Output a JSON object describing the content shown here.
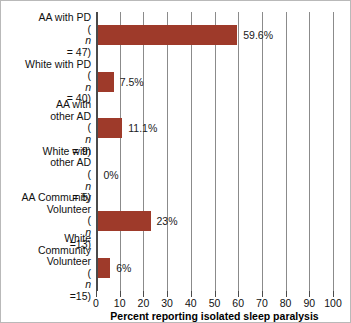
{
  "chart_data": {
    "type": "bar",
    "orientation": "horizontal",
    "title": "",
    "xlabel": "Percent reporting isolated sleep paralysis",
    "ylabel": "",
    "xlim": [
      0,
      100
    ],
    "xticks": [
      0,
      10,
      20,
      30,
      40,
      50,
      60,
      70,
      80,
      90,
      100
    ],
    "xtick_labels": [
      "0",
      "10",
      "20",
      "30",
      "40",
      "50",
      "60",
      "70",
      "80",
      "90",
      "100"
    ],
    "grid": "vertical",
    "legend": "none",
    "bar_color": "#9E3A2A",
    "categories": [
      "AA with PD (n = 47)",
      "White with PD (n = 40)",
      "AA with other AD (n = 9)",
      "White with other AD (n = 5)",
      "AA Community Volunteer (n =13)",
      "White Community Volunteer (n =15)"
    ],
    "values": [
      59.6,
      7.5,
      11.1,
      0,
      23,
      6
    ],
    "data_labels": [
      "59.6%",
      "7.5%",
      "11.1%",
      "0%",
      "23%",
      "6%"
    ],
    "bars": [
      {
        "label_lines": [
          "AA with PD"
        ],
        "n_prefix": "(",
        "n_symbol": "n",
        "n_suffix": " = 47)",
        "value": 59.6,
        "data_label": "59.6%"
      },
      {
        "label_lines": [
          "White with PD"
        ],
        "n_prefix": "(",
        "n_symbol": "n",
        "n_suffix": " = 40)",
        "value": 7.5,
        "data_label": "7.5%"
      },
      {
        "label_lines": [
          "AA with",
          "other AD"
        ],
        "n_prefix": "(",
        "n_symbol": "n",
        "n_suffix": " = 9)",
        "value": 11.1,
        "data_label": "11.1%"
      },
      {
        "label_lines": [
          "White with",
          "other AD"
        ],
        "n_prefix": "(",
        "n_symbol": "n",
        "n_suffix": " = 5)",
        "value": 0,
        "data_label": "0%"
      },
      {
        "label_lines": [
          "AA Community",
          "Volunteer"
        ],
        "n_prefix": "(",
        "n_symbol": "n",
        "n_suffix": " =13)",
        "value": 23,
        "data_label": "23%"
      },
      {
        "label_lines": [
          "White",
          "Community",
          "Volunteer"
        ],
        "n_prefix": "(",
        "n_symbol": "n",
        "n_suffix": " =15)",
        "value": 6,
        "data_label": "6%"
      }
    ]
  }
}
